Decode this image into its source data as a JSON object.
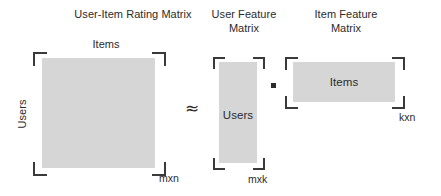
{
  "figure": {
    "kind": "matrix-factorization-diagram",
    "colors": {
      "matrix_fill": "#d6d6d6",
      "bracket": "#3a3a3a",
      "text": "#2b2b2b",
      "background": "#ffffff"
    }
  },
  "titles": {
    "rating_matrix": "User-Item Rating Matrix",
    "user_feature_matrix": "User Feature\nMatrix",
    "item_feature_matrix": "Item Feature\nMatrix"
  },
  "rating_matrix": {
    "top_axis_label": "Items",
    "side_axis_label": "Users",
    "dimension_label": "mxn"
  },
  "user_feature_matrix": {
    "inner_label": "Users",
    "dimension_label": "mxk"
  },
  "item_feature_matrix": {
    "inner_label": "Items",
    "dimension_label": "kxn"
  },
  "operators": {
    "approximation": "≈",
    "multiplication": "·"
  }
}
